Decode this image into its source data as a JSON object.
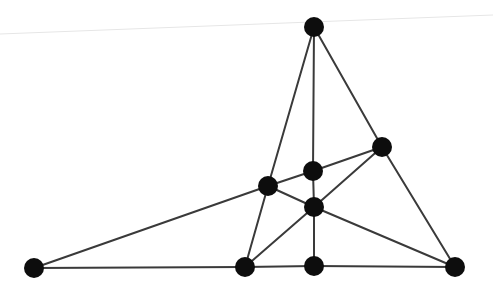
{
  "diagram": {
    "type": "graph",
    "node_radius": 10,
    "colors": {
      "node": "#0d0d0d",
      "edge": "#3a3a3a",
      "background": "#ffffff"
    },
    "nodes": [
      {
        "id": "A",
        "x": 314,
        "y": 27
      },
      {
        "id": "B",
        "x": 382,
        "y": 147
      },
      {
        "id": "C",
        "x": 313,
        "y": 171
      },
      {
        "id": "D",
        "x": 268,
        "y": 186
      },
      {
        "id": "E",
        "x": 314,
        "y": 207
      },
      {
        "id": "F",
        "x": 34,
        "y": 268
      },
      {
        "id": "G",
        "x": 245,
        "y": 267
      },
      {
        "id": "H",
        "x": 314,
        "y": 266
      },
      {
        "id": "I",
        "x": 455,
        "y": 267
      }
    ],
    "edges": [
      [
        "A",
        "D"
      ],
      [
        "D",
        "G"
      ],
      [
        "A",
        "C"
      ],
      [
        "C",
        "E"
      ],
      [
        "E",
        "H"
      ],
      [
        "A",
        "B"
      ],
      [
        "B",
        "I"
      ],
      [
        "F",
        "D"
      ],
      [
        "D",
        "C"
      ],
      [
        "C",
        "B"
      ],
      [
        "D",
        "E"
      ],
      [
        "E",
        "I"
      ],
      [
        "G",
        "E"
      ],
      [
        "E",
        "B"
      ],
      [
        "F",
        "G"
      ],
      [
        "G",
        "H"
      ],
      [
        "H",
        "I"
      ]
    ]
  }
}
